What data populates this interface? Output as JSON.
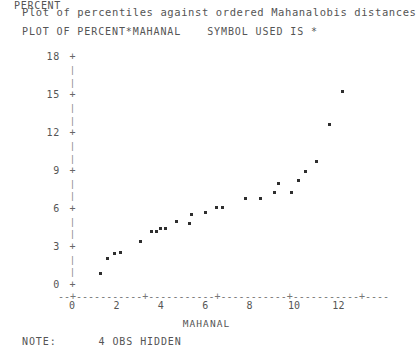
{
  "header": {
    "title": "Plot of percentiles against ordered Mahanalobis distances",
    "plot_of": "PLOT OF PERCENT*MAHANAL",
    "symbol_note": "SYMBOL USED IS *"
  },
  "footer": {
    "note_label": "NOTE:",
    "note_value": "4 OBS HIDDEN"
  },
  "axes": {
    "y_title": "PERCENT",
    "x_title": "MAHANAL",
    "y_ticks": [
      "18",
      "15",
      "12",
      "9",
      "6",
      "3",
      "0"
    ],
    "x_ticks": [
      "0",
      "2",
      "4",
      "6",
      "8",
      "10",
      "12"
    ],
    "tick_glyph": "+",
    "minor_glyph": "|",
    "x_axis_rule": "--+-----------+-----------+-----------+-----------+-----------+-----------+----"
  },
  "chart_data": {
    "type": "scatter",
    "title": "Plot of percentiles against ordered Mahanalobis distances",
    "subtitle": "PLOT OF PERCENT*MAHANAL   SYMBOL USED IS *",
    "xlabel": "MAHANAL",
    "ylabel": "PERCENT",
    "xlim": [
      0,
      13
    ],
    "ylim": [
      0,
      18
    ],
    "grid": false,
    "legend": null,
    "marker": "*",
    "note": "4 OBS HIDDEN",
    "points": [
      {
        "x": 1.3,
        "y": 0.9
      },
      {
        "x": 1.6,
        "y": 2.1
      },
      {
        "x": 1.9,
        "y": 2.5
      },
      {
        "x": 2.2,
        "y": 2.6
      },
      {
        "x": 3.1,
        "y": 3.4
      },
      {
        "x": 3.6,
        "y": 4.2
      },
      {
        "x": 3.8,
        "y": 4.2
      },
      {
        "x": 4.0,
        "y": 4.5
      },
      {
        "x": 4.2,
        "y": 4.5
      },
      {
        "x": 4.7,
        "y": 5.0
      },
      {
        "x": 5.3,
        "y": 4.9
      },
      {
        "x": 5.4,
        "y": 5.6
      },
      {
        "x": 6.0,
        "y": 5.7
      },
      {
        "x": 6.5,
        "y": 6.1
      },
      {
        "x": 6.8,
        "y": 6.1
      },
      {
        "x": 7.8,
        "y": 6.8
      },
      {
        "x": 8.5,
        "y": 6.8
      },
      {
        "x": 9.1,
        "y": 7.3
      },
      {
        "x": 9.3,
        "y": 8.0
      },
      {
        "x": 9.9,
        "y": 7.3
      },
      {
        "x": 10.2,
        "y": 8.3
      },
      {
        "x": 10.5,
        "y": 9.0
      },
      {
        "x": 11.0,
        "y": 9.8
      },
      {
        "x": 11.6,
        "y": 12.7
      },
      {
        "x": 12.2,
        "y": 15.3
      }
    ]
  },
  "geometry": {
    "x0_px": 72,
    "y0_px": 285,
    "px_per_x": 22.2,
    "px_per_y": 12.65
  }
}
